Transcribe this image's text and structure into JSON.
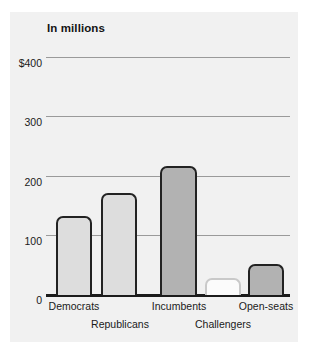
{
  "chart_data": {
    "type": "bar",
    "title": "In millions",
    "xlabel": "",
    "ylabel": "",
    "ylim": [
      0,
      400
    ],
    "grid": true,
    "legend": "none",
    "categories": [
      "Democrats",
      "Republicans",
      "Incumbents",
      "Challengers",
      "Open-seats"
    ],
    "values": [
      134,
      172,
      218,
      28,
      53
    ],
    "ytick_labels": [
      "$400",
      "300",
      "200",
      "100",
      "0"
    ],
    "ytick_values": [
      400,
      300,
      200,
      100,
      0
    ],
    "bars": [
      {
        "label": "Democrats",
        "value": 134,
        "fill": "#dddddd",
        "stroke": "#222222",
        "row": "top"
      },
      {
        "label": "Republicans",
        "value": 172,
        "fill": "#dddddd",
        "stroke": "#222222",
        "row": "bottom"
      },
      {
        "label": "Incumbents",
        "value": 218,
        "fill": "#b2b2b2",
        "stroke": "#222222",
        "row": "top"
      },
      {
        "label": "Challengers",
        "value": 28,
        "fill": "#fbfbfb",
        "stroke": "#c9c9c9",
        "row": "bottom"
      },
      {
        "label": "Open-seats",
        "value": 53,
        "fill": "#b2b2b2",
        "stroke": "#222222",
        "row": "top"
      }
    ]
  },
  "colors": {
    "panel_background": "#f1f1f1",
    "page_background": "#ffffff",
    "gridline": "#9a9a9a",
    "axis": "#1b1b1b",
    "text": "#1a1a1a"
  }
}
